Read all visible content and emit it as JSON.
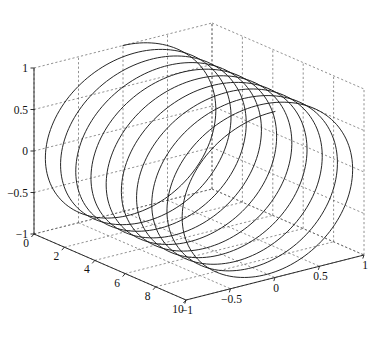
{
  "figure": {
    "title": "",
    "background": "#ffffff",
    "line_color": "#1a1a1a",
    "grid_color": "#555555",
    "axis_color": "#1c1c1c"
  },
  "chart_data": {
    "type": "line",
    "title": "",
    "subtitle": "",
    "projection": "3d",
    "xlabel": "",
    "ylabel": "",
    "zlabel": "",
    "xlim": [
      0,
      10
    ],
    "ylim": [
      -1,
      1
    ],
    "zlim": [
      -1,
      1
    ],
    "grid": true,
    "legend": null,
    "legend_position": "none",
    "xticks": [
      0,
      2,
      4,
      6,
      8,
      10
    ],
    "xticklabels": [
      "0",
      "2",
      "4",
      "6",
      "8",
      "10"
    ],
    "yticks": [
      -1,
      -0.5,
      0,
      0.5,
      1
    ],
    "yticklabels": [
      "−1",
      "−0.5",
      "0",
      "0.5",
      "1"
    ],
    "zticks": [
      -1,
      -0.5,
      0,
      0.5,
      1
    ],
    "zticklabels": [
      "−1",
      "−0.5",
      "0",
      "0.5",
      "1"
    ],
    "series": [
      {
        "name": "helix",
        "kind": "parametric-3d",
        "equation_x": "t",
        "equation_y": "sin(2*pi*t)",
        "equation_z": "cos(2*pi*t)",
        "t_range": [
          0,
          10
        ],
        "turns": 10,
        "samples": 1400,
        "amplitude": 1,
        "color": "#1a1a1a",
        "linewidth": 0.95,
        "description": "Helical curve: circles of radius 1 in the y-z plane advancing linearly along x from 0 to 10, completing 10 full revolutions."
      }
    ]
  },
  "view": {
    "azimuth_deg": -37.5,
    "elevation_deg": 30,
    "box_aspect": [
      1.9,
      1.0,
      1.0
    ]
  },
  "labels": {
    "z_ticks": [
      "1",
      "0.5",
      "0",
      "−0.5",
      "−1"
    ],
    "x_ticks": [
      "0",
      "2",
      "4",
      "6",
      "8",
      "10"
    ],
    "y_ticks": [
      "−1",
      "−0.5",
      "0",
      "0.5",
      "1"
    ]
  }
}
